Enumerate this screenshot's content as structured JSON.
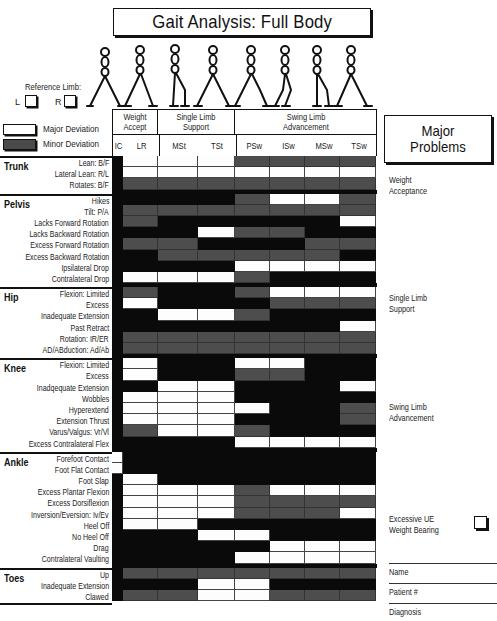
{
  "title": "Gait Analysis:  Full Body",
  "reference_limb": {
    "label": "Reference Limb:",
    "left": "L",
    "right": "R"
  },
  "legend": {
    "major": "Major Deviation",
    "minor": "Minor Deviation"
  },
  "colors": {
    "not_applicable": "#0a0a0a",
    "minor": "#4d4d4d",
    "major": "#fdfdfd"
  },
  "phases": [
    {
      "label": "Weight Accept"
    },
    {
      "label": "Single Limb Support"
    },
    {
      "label": "Swing Limb Advancement"
    }
  ],
  "subphases": [
    "IC",
    "LR",
    "MSt",
    "TSt",
    "PSw",
    "ISw",
    "MSw",
    "TSw"
  ],
  "sections": [
    {
      "name": "Trunk",
      "rows": [
        {
          "label": "Lean:  B/F",
          "cells": "BWWWGGGG"
        },
        {
          "label": "Lateral Lean:  R/L",
          "cells": "BWWWWWWW"
        },
        {
          "label": "Rotates:  B/F",
          "cells": "BGGGGGGG"
        }
      ]
    },
    {
      "name": "Pelvis",
      "rows": [
        {
          "label": "Hikes",
          "cells": "BBBBGWWG"
        },
        {
          "label": "Tilt:  P/A",
          "cells": "BGGGGGGG"
        },
        {
          "label": "Lacks Forward Rotation",
          "cells": "BGBBBBBW"
        },
        {
          "label": "Lacks Backward Rotation",
          "cells": "BBBWGGBB"
        },
        {
          "label": "Excess Forward Rotation",
          "cells": "BGGBBBGG"
        },
        {
          "label": "Excess Backward Rotation",
          "cells": "BBGGGGGB"
        },
        {
          "label": "Ipsilateral Drop",
          "cells": "BBBBWWWW"
        },
        {
          "label": "Contralateral Drop",
          "cells": "BWWWGBBB"
        }
      ]
    },
    {
      "name": "Hip",
      "rows": [
        {
          "label": "Flexion:  Limited",
          "cells": "BGBBGWWW"
        },
        {
          "label": "Excess",
          "cells": "BWBBBGGG"
        },
        {
          "label": "Inadequate Extension",
          "cells": "BBWWGBBB"
        },
        {
          "label": "Past Retract",
          "cells": "BBBBBBBW"
        },
        {
          "label": "Rotation:  IR/ER",
          "cells": "BGGGGGGG"
        },
        {
          "label": "AD/ABduction:  Ad/Ab",
          "cells": "BGGGGGGG"
        }
      ]
    },
    {
      "name": "Knee",
      "rows": [
        {
          "label": "Flexion:  Limited",
          "cells": "BWBBWWBB"
        },
        {
          "label": "Excess",
          "cells": "BWBBGGBB"
        },
        {
          "label": "Inadqequate Extension",
          "cells": "BBWWBBBW"
        },
        {
          "label": "Wobbles",
          "cells": "BWWWBBBB"
        },
        {
          "label": "Hyperextend",
          "cells": "BWWWWBBG"
        },
        {
          "label": "Extension Thrust",
          "cells": "BWWWBBBG"
        },
        {
          "label": "Varus/Valgus:  Vr/Vl",
          "cells": "BGWWGBBB"
        },
        {
          "label": "Excess Contralateral Flex",
          "cells": "BBBBWWWW"
        }
      ]
    },
    {
      "name": "Ankle",
      "rows": [
        {
          "label": "Forefoot Contact",
          "cells": "WBBBBBBB"
        },
        {
          "label": "Foot Flat Contact",
          "cells": "WBBBBBBB"
        },
        {
          "label": "Foot Slap",
          "cells": "BWBBBBBB"
        },
        {
          "label": "Excess Plantar Flexion",
          "cells": "BWWWGWWW"
        },
        {
          "label": "Excess Dorsiflexion",
          "cells": "BWWWGGGG"
        },
        {
          "label": "Inversion/Eversion:  Iv/Ev",
          "cells": "BWWWGGGW"
        },
        {
          "label": "Heel Off",
          "cells": "BWWBBBBB"
        },
        {
          "label": "No Heel Off",
          "cells": "BBBWWBBB"
        },
        {
          "label": "Drag",
          "cells": "BBBBBWWW"
        },
        {
          "label": "Contralateral Vaulting",
          "cells": "BBBBWWWW"
        }
      ]
    },
    {
      "name": "Toes",
      "rows": [
        {
          "label": "Up",
          "cells": "BGGGGGGG"
        },
        {
          "label": "Inadequate Extension",
          "cells": "BBBWWBBB"
        },
        {
          "label": "Clawed",
          "cells": "BGGWWGGG"
        }
      ]
    }
  ],
  "major_problems": {
    "title": "Major Problems",
    "items": [
      "Weight Acceptance",
      "Single Limb Support",
      "Swing Limb Advancement",
      "Excessive UE Weight Bearing"
    ]
  },
  "fields": [
    "Name",
    "Patient #",
    "Diagnosis"
  ]
}
